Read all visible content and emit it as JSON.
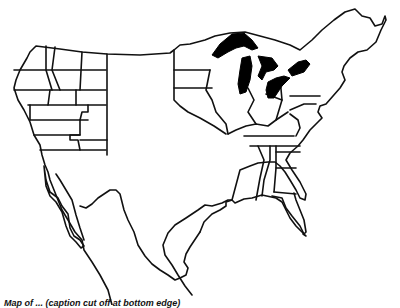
{
  "figure": {
    "type": "outline-map",
    "region": "United States with southern Canada border and northern Mexico",
    "highlighted_feature": "Great Lakes (filled black)",
    "colors": {
      "background": "#ffffff",
      "line": "#111111",
      "highlight": "#000000"
    },
    "caption_visible_fragment": "Map of ... (caption cut off at bottom edge)"
  }
}
